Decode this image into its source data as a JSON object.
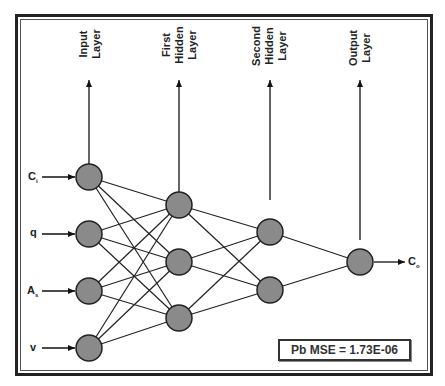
{
  "layers": [
    {
      "name": "input",
      "label_lines": [
        "Input",
        "Layer"
      ],
      "nodes": 4
    },
    {
      "name": "first-hidden",
      "label_lines": [
        "First",
        "Hidden",
        "Layer"
      ],
      "nodes": 3
    },
    {
      "name": "second-hidden",
      "label_lines": [
        "Second",
        "Hidden",
        "Layer"
      ],
      "nodes": 2
    },
    {
      "name": "output",
      "label_lines": [
        "Output",
        "Layer"
      ],
      "nodes": 1
    }
  ],
  "labels": {
    "input_layer": "Input\nLayer",
    "first_hidden_layer": "First\nHidden\nLayer",
    "second_hidden_layer": "Second\nHidden\nLayer",
    "output_layer": "Output\nLayer"
  },
  "inputs": [
    {
      "base": "C",
      "sub": "i"
    },
    {
      "base": "q",
      "sub": ""
    },
    {
      "base": "A",
      "sub": "s"
    },
    {
      "base": "v",
      "sub": ""
    }
  ],
  "output": {
    "base": "C",
    "sub": "o"
  },
  "metric": {
    "text": "Pb MSE = 1.73E-06"
  },
  "colors": {
    "node_fill": "#8a8a8a",
    "node_stroke": "#222222",
    "line": "#222222"
  }
}
